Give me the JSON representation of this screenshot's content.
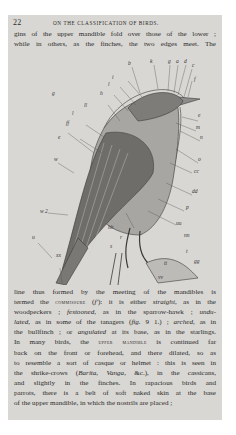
{
  "header": {
    "page_number": "22",
    "running_title": "ON THE CLASSIFICATION OF BIRDS."
  },
  "top_text": {
    "lines": [
      "gins of the upper mandible fold over those of the lower ;",
      "while in others, as the finches, the two edges meet.  The"
    ]
  },
  "figure": {
    "caption": "",
    "labels": {
      "g": "g",
      "b": "b",
      "k": "k",
      "gg": "g",
      "a_top": "a",
      "d": "d",
      "c": "c",
      "ll": "ll",
      "l": "l",
      "h_left": "h",
      "ff": "ff",
      "f": "f",
      "e": "e",
      "m": "m",
      "n": "n",
      "o": "o",
      "cc": "cc",
      "dd": "dd",
      "p": "p",
      "uu": "uu",
      "nn": "nn",
      "w": "w",
      "w2": "w 2",
      "hh": "hh",
      "r": "r",
      "s": "s",
      "u_left": "u",
      "xx": "xx",
      "t": "t",
      "tt": "tt",
      "vv": "vv",
      "gg_foot": "gg",
      "i": "i",
      "u_bottom": "u"
    }
  },
  "bottom_text": {
    "lines": [
      {
        "parts": [
          {
            "t": "line thus formed by the meeting of the mandibles is",
            "s": ""
          }
        ]
      },
      {
        "parts": [
          {
            "t": "termed the ",
            "s": ""
          },
          {
            "t": "commissure",
            "s": "sc"
          },
          {
            "t": " (",
            "s": ""
          },
          {
            "t": "f'",
            "s": "it"
          },
          {
            "t": "): it is either ",
            "s": ""
          },
          {
            "t": "straight",
            "s": "it"
          },
          {
            "t": ", as in the",
            "s": ""
          }
        ]
      },
      {
        "parts": [
          {
            "t": "woodpeckers ; ",
            "s": ""
          },
          {
            "t": "festooned",
            "s": "it"
          },
          {
            "t": ", as in the sparrow-hawk ; ",
            "s": ""
          },
          {
            "t": "undu-",
            "s": "it"
          }
        ]
      },
      {
        "parts": [
          {
            "t": "lated",
            "s": "it"
          },
          {
            "t": ", as in some of the tanagers (",
            "s": ""
          },
          {
            "t": "fig.",
            "s": "it"
          },
          {
            "t": " 9 1.) ; ",
            "s": ""
          },
          {
            "t": "arched",
            "s": "it"
          },
          {
            "t": ", as in",
            "s": ""
          }
        ]
      },
      {
        "parts": [
          {
            "t": "the bullfinch ; or ",
            "s": ""
          },
          {
            "t": "angulated",
            "s": "it"
          },
          {
            "t": " at its base, as in the starlings.",
            "s": ""
          }
        ]
      },
      {
        "parts": [
          {
            "t": "In many birds, the ",
            "s": ""
          },
          {
            "t": "upper mandible",
            "s": "sc"
          },
          {
            "t": " is continued far",
            "s": ""
          }
        ]
      },
      {
        "parts": [
          {
            "t": "back on the front or forehead, and there dilated, so as",
            "s": ""
          }
        ]
      },
      {
        "parts": [
          {
            "t": "to resemble a sort of casque or helmet : this is seen in",
            "s": ""
          }
        ]
      },
      {
        "parts": [
          {
            "t": "the shrike-crows (",
            "s": ""
          },
          {
            "t": "Barita, Vanga,",
            "s": "it"
          },
          {
            "t": " &c.), in the cassicans,",
            "s": ""
          }
        ]
      },
      {
        "parts": [
          {
            "t": "and slightly in the finches.  In rapacious birds and",
            "s": ""
          }
        ]
      },
      {
        "parts": [
          {
            "t": "parrots, there is a belt of soft naked skin at the base",
            "s": ""
          }
        ]
      },
      {
        "parts": [
          {
            "t": "of the upper mandible, in which the nostrils are placed ;",
            "s": ""
          }
        ]
      }
    ]
  },
  "colors": {
    "page_bg": "#d9d7d3",
    "ink": "#2a2a2a",
    "outer_bg": "#ffffff"
  }
}
